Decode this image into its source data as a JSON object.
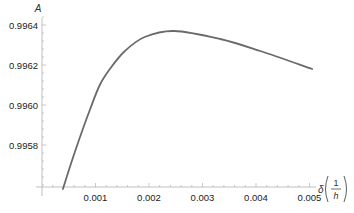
{
  "chart_data": {
    "type": "line",
    "title": "",
    "xlabel": "δ(1/h)",
    "ylabel": "A",
    "xlim": [
      0,
      0.0052
    ],
    "ylim": [
      0.99558,
      0.99646
    ],
    "grid": false,
    "legend": null,
    "x_ticks": [
      "0.001",
      "0.002",
      "0.003",
      "0.004",
      "0.005"
    ],
    "y_ticks": [
      "0.9958",
      "0.9960",
      "0.9962",
      "0.9964"
    ],
    "series": [
      {
        "name": "A",
        "color": "#6a6a6a",
        "x": [
          0.00039,
          0.00062,
          0.0009,
          0.00108,
          0.00127,
          0.00155,
          0.00192,
          0.00247,
          0.00333,
          0.00408,
          0.00505
        ],
        "y": [
          0.99558,
          0.99577,
          0.99598,
          0.9961,
          0.99618,
          0.99627,
          0.99634,
          0.99637,
          0.99633,
          0.99627,
          0.99618
        ]
      }
    ]
  },
  "axes": {
    "y_title": "A",
    "x_title_prefix": "δ",
    "x_title_num": "1",
    "x_title_den": "h"
  }
}
